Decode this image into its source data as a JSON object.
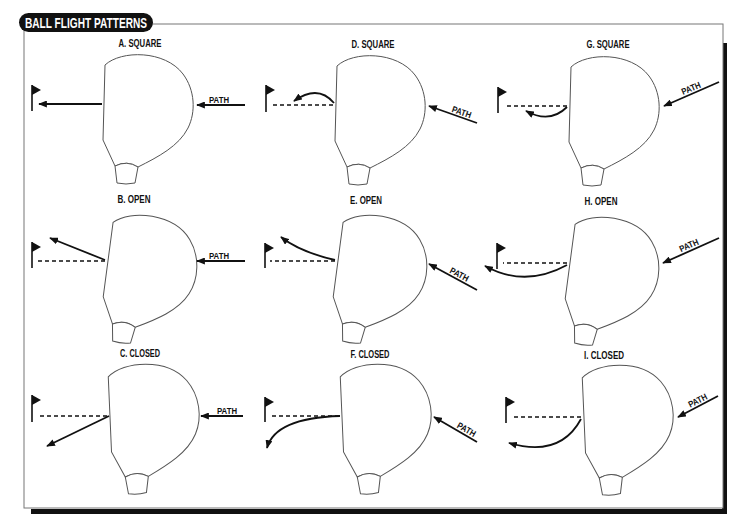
{
  "title": "BALL FLIGHT PATTERNS",
  "colors": {
    "ink": "#111111",
    "outline": "#555555",
    "background": "#ffffff"
  },
  "panels": {
    "A": {
      "label": "A. SQUARE",
      "path_label": "PATH"
    },
    "B": {
      "label": "B. OPEN",
      "path_label": "PATH"
    },
    "C": {
      "label": "C. CLOSED",
      "path_label": "PATH"
    },
    "D": {
      "label": "D. SQUARE",
      "path_label": "PATH"
    },
    "E": {
      "label": "E. OPEN",
      "path_label": "PATH"
    },
    "F": {
      "label": "F. CLOSED",
      "path_label": "PATH"
    },
    "G": {
      "label": "G. SQUARE",
      "path_label": "PATH"
    },
    "H": {
      "label": "H. OPEN",
      "path_label": "PATH"
    },
    "I": {
      "label": "I. CLOSED",
      "path_label": "PATH"
    }
  },
  "icons": {
    "flag": "flag-icon",
    "arrow": "arrow-icon"
  }
}
